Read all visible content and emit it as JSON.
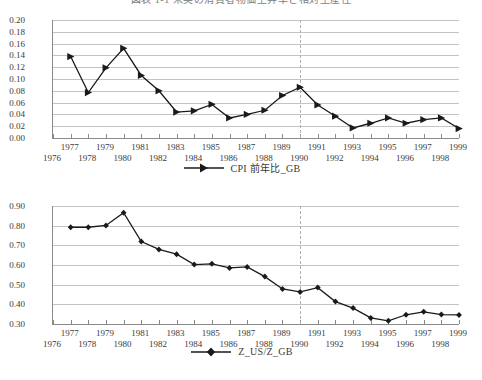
{
  "figure": {
    "caption": "図表 1-1  米英の消費者物価上昇率と相対生産性"
  },
  "chart_data": [
    {
      "id": "cpi-gb",
      "type": "line",
      "title": "",
      "xlabel": "",
      "ylabel": "",
      "legend": "CPI 前年比_GB",
      "legend_position": "bottom",
      "marker": "right-triangle",
      "grid": true,
      "series_color": "#1a1a1a",
      "xlim": [
        1976,
        1999
      ],
      "ylim": [
        0.0,
        0.2
      ],
      "yticks": [
        "0.20",
        "0.18",
        "0.16",
        "0.14",
        "0.12",
        "0.10",
        "0.08",
        "0.06",
        "0.04",
        "0.02",
        "0.00"
      ],
      "xticks_upper": [
        "1977",
        "1979",
        "1981",
        "1983",
        "1985",
        "1987",
        "1989",
        "1991",
        "1993",
        "1995",
        "1997",
        "1999"
      ],
      "xticks_lower": [
        "1976",
        "1978",
        "1980",
        "1982",
        "1984",
        "1986",
        "1988",
        "1990",
        "1992",
        "1994",
        "1996",
        "1998"
      ],
      "annotation_vline_x": 1990,
      "x": [
        1977,
        1978,
        1979,
        1980,
        1981,
        1982,
        1983,
        1984,
        1985,
        1986,
        1987,
        1988,
        1989,
        1990,
        1991,
        1992,
        1993,
        1994,
        1995,
        1996,
        1997,
        1998,
        1999
      ],
      "values": [
        0.138,
        0.077,
        0.119,
        0.152,
        0.106,
        0.08,
        0.044,
        0.046,
        0.057,
        0.034,
        0.04,
        0.047,
        0.072,
        0.086,
        0.056,
        0.037,
        0.017,
        0.025,
        0.034,
        0.025,
        0.031,
        0.034,
        0.016
      ]
    },
    {
      "id": "z-us-z-gb",
      "type": "line",
      "title": "",
      "xlabel": "",
      "ylabel": "",
      "legend": "Z_US/Z_GB",
      "legend_position": "bottom",
      "marker": "diamond",
      "grid": true,
      "series_color": "#1a1a1a",
      "xlim": [
        1976,
        1999
      ],
      "ylim": [
        0.3,
        0.9
      ],
      "yticks": [
        "0.90",
        "0.80",
        "0.70",
        "0.60",
        "0.50",
        "0.40",
        "0.30"
      ],
      "xticks_upper": [
        "1977",
        "1979",
        "1981",
        "1983",
        "1985",
        "1987",
        "1989",
        "1991",
        "1993",
        "1995",
        "1997",
        "1999"
      ],
      "xticks_lower": [
        "1976",
        "1978",
        "1980",
        "1982",
        "1984",
        "1986",
        "1988",
        "1990",
        "1992",
        "1994",
        "1996",
        "1998"
      ],
      "annotation_vline_x": 1990,
      "x": [
        1977,
        1978,
        1979,
        1980,
        1981,
        1982,
        1983,
        1984,
        1985,
        1986,
        1987,
        1988,
        1989,
        1990,
        1991,
        1992,
        1993,
        1994,
        1995,
        1996,
        1997,
        1998,
        1999
      ],
      "values": [
        0.792,
        0.792,
        0.801,
        0.866,
        0.719,
        0.679,
        0.655,
        0.602,
        0.606,
        0.585,
        0.59,
        0.541,
        0.478,
        0.463,
        0.485,
        0.414,
        0.381,
        0.331,
        0.316,
        0.347,
        0.362,
        0.348,
        0.346
      ]
    }
  ]
}
